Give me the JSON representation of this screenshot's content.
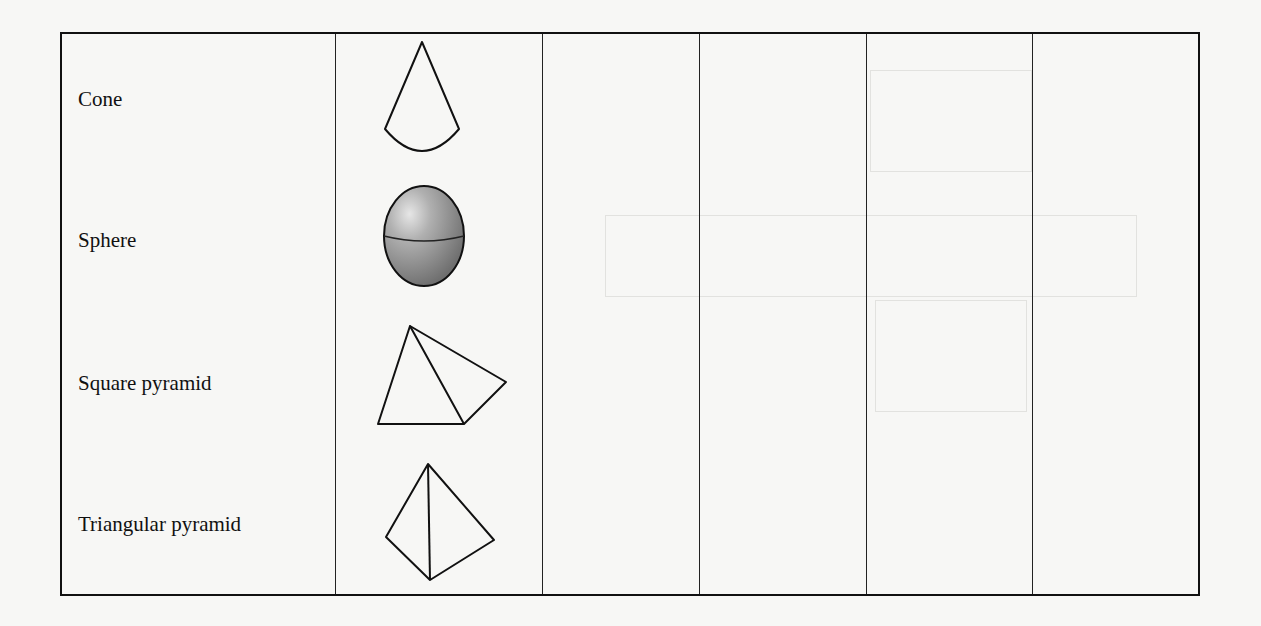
{
  "document": {
    "type": "worksheet-table",
    "description": "3D shapes table with name column, picture column and four empty answer columns"
  },
  "table": {
    "columns": [
      {
        "key": "name",
        "header": ""
      },
      {
        "key": "picture",
        "header": ""
      },
      {
        "key": "blank_1",
        "header": ""
      },
      {
        "key": "blank_2",
        "header": ""
      },
      {
        "key": "blank_3",
        "header": ""
      },
      {
        "key": "blank_4",
        "header": ""
      }
    ],
    "rows": [
      {
        "name": "Cone",
        "picture_icon": "cone-icon",
        "blank_1": "",
        "blank_2": "",
        "blank_3": "",
        "blank_4": ""
      },
      {
        "name": "Sphere",
        "picture_icon": "sphere-icon",
        "blank_1": "",
        "blank_2": "",
        "blank_3": "",
        "blank_4": ""
      },
      {
        "name": "Square pyramid",
        "picture_icon": "square-pyramid-icon",
        "blank_1": "",
        "blank_2": "",
        "blank_3": "",
        "blank_4": ""
      },
      {
        "name": "Triangular pyramid",
        "picture_icon": "triangular-pyramid-icon",
        "blank_1": "",
        "blank_2": "",
        "blank_3": "",
        "blank_4": ""
      }
    ]
  },
  "colors": {
    "paper": "#f7f7f5",
    "ink": "#111111",
    "sphere_light": "#d9d9d9",
    "sphere_dark": "#7d7d7d"
  }
}
